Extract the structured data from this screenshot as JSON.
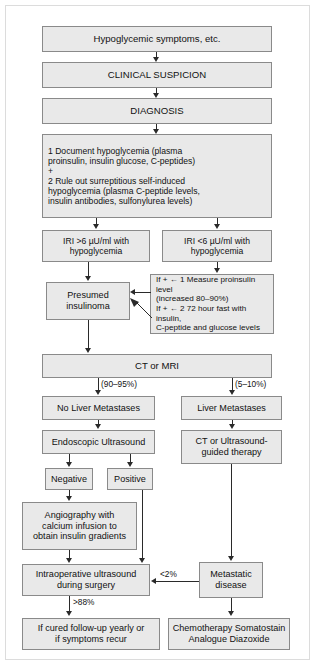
{
  "diagram": {
    "colors": {
      "node_fill": "#e9e9e9",
      "node_border": "#8a8a8a",
      "connector": "#2a2a2a",
      "frame": "#dcdcdc",
      "background": "#ffffff"
    },
    "nodes": {
      "hypoglycemic_symptoms": "Hypoglycemic symptoms, etc.",
      "clinical_suspicion": "CLINICAL SUSPICION",
      "diagnosis": "DIAGNOSIS",
      "workup": "1  Document hypoglycemia (plasma\n proinsulin, insulin glucose, C-peptides)\n+\n2  Rule out surreptitious self-induced\n hypoglycemia (plasma C-peptide levels,\n insulin antibodies, sulfonylurea levels)",
      "iri_high": "IRI >6 µU/ml with\nhypoglycemia",
      "iri_low": "IRI <6 µU/ml with\nhypoglycemia",
      "presumed_insulinoma": "Presumed\ninsulinoma",
      "confirm_tests": "If + ← 1 Measure proinsulin level\n    (increased 80–90%)\nIf + ← 2 72 hour fast with insulin,\n    C-peptide and glucose levels",
      "ct_or_mri": "CT or MRI",
      "no_liver_metastases": "No Liver Metastases",
      "liver_metastases": "Liver Metastases",
      "endoscopic_ultrasound": "Endoscopic Ultrasound",
      "negative": "Negative",
      "positive": "Positive",
      "ct_ultrasound_guided": "CT or Ultrasound-\nguided therapy",
      "angiography": "Angiography with\ncalcium infusion to\nobtain insulin gradients",
      "intraoperative_ultrasound": "Intraoperative ultrasound\nduring surgery",
      "metastatic_disease": "Metastatic\ndisease",
      "if_cured": "If cured follow-up yearly or\nif symptoms recur",
      "chemotherapy": "Chemotherapy Somatostain\nAnalogue Diazoxide"
    },
    "edge_labels": {
      "no_liver_pct": "(90–95%)",
      "liver_pct": "(5–10%)",
      "metastatic_pct": "<2%",
      "cured_pct": ">88%"
    }
  }
}
